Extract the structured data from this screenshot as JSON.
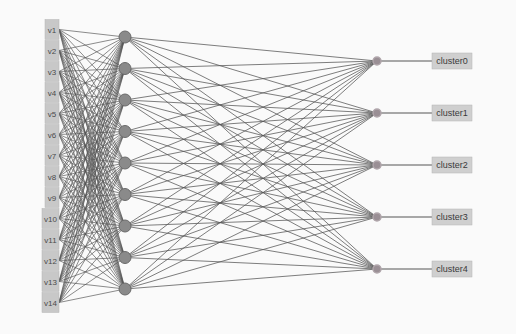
{
  "diagram": {
    "type": "neural-network",
    "colors": {
      "background": "#fafafa",
      "edge": "#555555",
      "node_fill": "#8a8a8a",
      "node_stroke": "#6a6a6a",
      "input_box": "#c8c8c8",
      "output_box": "#cfcfcf"
    },
    "input_layer": [
      "v1",
      "v2",
      "v3",
      "v4",
      "v5",
      "v6",
      "v7",
      "v8",
      "v9",
      "v10",
      "v11",
      "v12",
      "v13",
      "v14"
    ],
    "hidden_layer_count": 9,
    "output_layer": [
      "cluster0",
      "cluster1",
      "cluster2",
      "cluster3",
      "cluster4"
    ],
    "connectivity": "fully-connected"
  }
}
